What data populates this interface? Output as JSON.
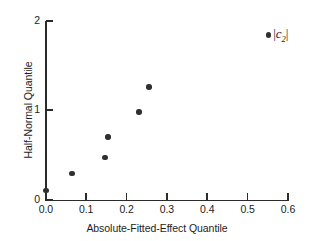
{
  "chart_data": {
    "type": "scatter",
    "title": "",
    "subtitle": "",
    "xlabel": "Absolute-Fitted-Effect Quantile",
    "ylabel": "Half-Normal Quantile",
    "xlim": [
      0.0,
      0.6
    ],
    "ylim": [
      0,
      2
    ],
    "xticks": [
      "0.0",
      "0.1",
      "0.2",
      "0.3",
      "0.4",
      "0.5",
      "0.6"
    ],
    "xtick_values": [
      0.0,
      0.1,
      0.2,
      0.3,
      0.4,
      0.5,
      0.6
    ],
    "yticks": [
      "0",
      "1",
      "2"
    ],
    "ytick_values": [
      0,
      1,
      2
    ],
    "grid": false,
    "legend_position": "top-right",
    "series": [
      {
        "name": "|c2|",
        "marker": "filled-circle",
        "color": "#303030",
        "x": [
          0.0,
          0.065,
          0.147,
          0.154,
          0.231,
          0.256
        ],
        "y": [
          0.1,
          0.29,
          0.47,
          0.7,
          0.98,
          1.26
        ]
      }
    ],
    "legend": [
      {
        "label_prefix": "|",
        "label_base": "c",
        "label_sub": "2",
        "label_suffix": "|",
        "marker": "filled-circle",
        "color": "#303030"
      }
    ],
    "annotations": []
  },
  "axes": {
    "y_title": "Half-Normal Quantile",
    "x_title": "Absolute-Fitted-Effect Quantile"
  },
  "colors": {
    "marker": "#303030",
    "axis": "#2b2b2b",
    "text": "#1d1d1d",
    "background": "#ffffff"
  }
}
